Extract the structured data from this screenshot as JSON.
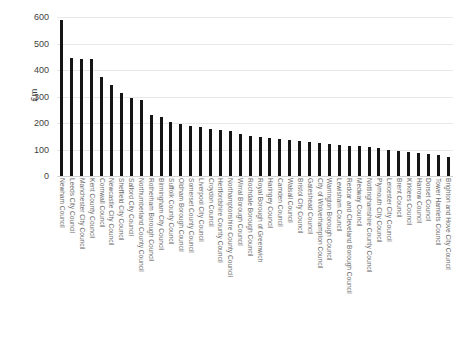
{
  "chart_data": {
    "type": "bar",
    "title": "",
    "xlabel": "",
    "ylabel": "£m",
    "ylim": [
      0,
      600
    ],
    "ytick_values": [
      600,
      500,
      400,
      300,
      200,
      100,
      0
    ],
    "ytick_labels": [
      "600",
      "500",
      "400",
      "300",
      "200",
      "100",
      "0"
    ],
    "grid": true,
    "legend": "none",
    "bar_color": "#151515",
    "categories": [
      "Newham Council",
      "Leeds City Council",
      "Manchester City Council",
      "Kent County Council",
      "Cornwall Council",
      "Newcastle City Council",
      "Sheffield City Council",
      "Salford City Council",
      "Northumberland County Council",
      "Rotherham Borough Council",
      "Birmingham City Council",
      "Suffolk County Council",
      "Oldham Borough Council",
      "Somerset County Council",
      "Liverpool City Council",
      "Croydon Council",
      "Hertfordshire County Council",
      "Northamptonshire County Council",
      "Wirral Borough Council",
      "Rochdale Borough Council",
      "Royal Borough of Greenwich",
      "Haringey Council",
      "Camden Council",
      "Walsall Council",
      "Bristol City Council",
      "Gateshead Council",
      "City of Wolverhampton Council",
      "Warrington Borough Council",
      "Lewisham Council",
      "Redcar and Cleveland Borough Council",
      "Medway Council",
      "Nottinghamshire County Council",
      "Plymouth City Council",
      "Leicester City Council",
      "Brent Council",
      "Kirklees Council",
      "Harrow Council",
      "Dorset Council",
      "Tower Hamlets Council",
      "Brighton and Hove City Council"
    ],
    "values": [
      590,
      445,
      440,
      440,
      375,
      345,
      315,
      295,
      285,
      230,
      222,
      205,
      198,
      190,
      185,
      178,
      172,
      168,
      160,
      152,
      148,
      145,
      140,
      136,
      132,
      128,
      124,
      120,
      118,
      115,
      112,
      108,
      105,
      100,
      96,
      92,
      88,
      84,
      78,
      70
    ]
  }
}
